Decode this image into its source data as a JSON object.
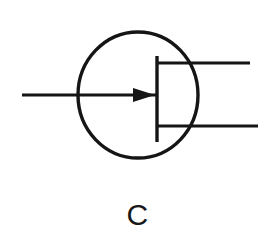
{
  "figure": {
    "caption": "C",
    "title": "",
    "background_color": "#ffffff",
    "stroke_color": "#151515"
  },
  "diagram": {
    "type": "electronic-schematic-symbol",
    "envelope": {
      "shape": "ellipse",
      "center_x": 138,
      "center_y": 95,
      "radius_x": 60,
      "radius_y": 63,
      "stroke_width": 3.4
    },
    "electrode_bar": {
      "shape": "vertical-line",
      "x": 157,
      "y_top": 56,
      "y_bottom": 142,
      "stroke_width": 3.4
    },
    "leads": [
      {
        "name": "input-lead-left",
        "x_start": 22,
        "x_end": 157,
        "y": 95,
        "stroke_width": 3.2,
        "arrowhead": true,
        "arrow_direction": "right",
        "arrow_tip_x": 155,
        "arrow_tail_x": 133,
        "arrow_half_height": 7
      },
      {
        "name": "output-lead-upper-right",
        "x_start": 157,
        "x_end": 250,
        "y": 63,
        "stroke_width": 3.2,
        "arrowhead": false
      },
      {
        "name": "output-lead-lower-right",
        "x_start": 157,
        "x_end": 258,
        "y": 126,
        "stroke_width": 3.2,
        "arrowhead": false
      }
    ]
  }
}
